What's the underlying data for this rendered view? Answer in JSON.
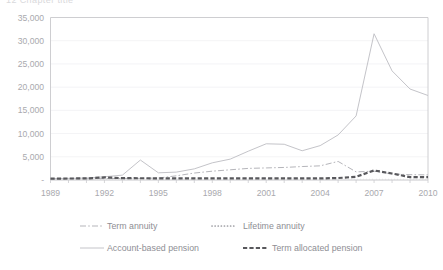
{
  "page": {
    "cropped_header_text": "12     Chapter title"
  },
  "chart_data": {
    "type": "line",
    "title": "",
    "xlabel": "",
    "ylabel": "",
    "xlim": [
      1989,
      2010
    ],
    "ylim": [
      0,
      35000
    ],
    "grid": true,
    "legend_position": "bottom",
    "x": [
      1989,
      1990,
      1991,
      1992,
      1993,
      1994,
      1995,
      1996,
      1997,
      1998,
      1999,
      2000,
      2001,
      2002,
      2003,
      2004,
      2005,
      2006,
      2007,
      2008,
      2009,
      2010
    ],
    "xtick_labels": [
      "1989",
      "1992",
      "1995",
      "1998",
      "2001",
      "2004",
      "2007",
      "2010"
    ],
    "xticks": [
      1989,
      1992,
      1995,
      1998,
      2001,
      2004,
      2007,
      2010
    ],
    "yticks": [
      0,
      5000,
      10000,
      15000,
      20000,
      25000,
      30000,
      35000
    ],
    "ytick_labels": [
      "-",
      "5,000",
      "10,000",
      "15,000",
      "20,000",
      "25,000",
      "30,000",
      "35,000"
    ],
    "series": [
      {
        "name": "Term annuity",
        "style": "dash-dot",
        "color": "#b5b5ba",
        "values": [
          250,
          260,
          280,
          300,
          330,
          360,
          420,
          900,
          1500,
          1900,
          2200,
          2500,
          2600,
          2700,
          2900,
          3050,
          4000,
          1750,
          1900,
          1300,
          1150,
          1100
        ]
      },
      {
        "name": "Lifetime annuity",
        "style": "dotted",
        "color": "#9d9da3",
        "values": [
          120,
          130,
          140,
          150,
          160,
          170,
          180,
          200,
          210,
          220,
          230,
          240,
          250,
          250,
          250,
          240,
          230,
          220,
          210,
          200,
          190,
          180
        ]
      },
      {
        "name": "Account-based pension",
        "style": "solid",
        "color": "#c4c4c9",
        "values": [
          300,
          350,
          420,
          700,
          1050,
          4300,
          1550,
          1700,
          2400,
          3700,
          4500,
          6200,
          7800,
          7700,
          6300,
          7400,
          9700,
          13800,
          31500,
          23500,
          19600,
          18200
        ]
      },
      {
        "name": "Term allocated pension",
        "style": "thick-dash",
        "color": "#58585c",
        "values": [
          300,
          320,
          340,
          560,
          400,
          380,
          360,
          350,
          340,
          330,
          330,
          330,
          330,
          330,
          330,
          340,
          420,
          700,
          2050,
          1400,
          620,
          600
        ]
      }
    ]
  },
  "legend": {
    "items": [
      {
        "label": "Term annuity"
      },
      {
        "label": "Lifetime annuity"
      },
      {
        "label": "Account-based pension"
      },
      {
        "label": "Term allocated pension"
      }
    ]
  }
}
